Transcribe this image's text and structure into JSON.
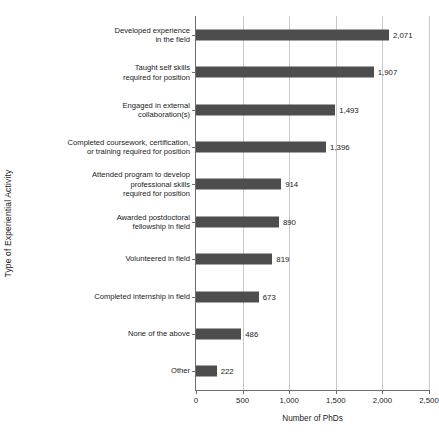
{
  "chart_data": {
    "type": "bar",
    "orientation": "horizontal",
    "title": "",
    "xlabel": "Number of PhDs",
    "ylabel": "Type of Experiential Activity",
    "xlim": [
      0,
      2500
    ],
    "xticks": [
      0,
      500,
      1000,
      1500,
      2000,
      2500
    ],
    "xtick_labels": [
      "0",
      "500",
      "1,000",
      "1,500",
      "2,000",
      "2,500"
    ],
    "grid": "vertical",
    "legend": "none",
    "bar_color": "#4d4d4d",
    "gridline_color": "#c9c9c9",
    "axis_color": "#6e6e6e",
    "categories": [
      "Developed experience\nin the field",
      "Taught self skills\nrequired for position",
      "Engaged in external\ncollaboration(s)",
      "Completed coursework, certification,\nor training required for position",
      "Attended program to develop\nprofessional skills\nrequired for position",
      "Awarded postdoctoral\nfellowship in field",
      "Volunteered in field",
      "Completed internship in field",
      "None of the above",
      "Other"
    ],
    "values": [
      2071,
      1907,
      1493,
      1396,
      914,
      890,
      819,
      673,
      486,
      222
    ],
    "value_labels": [
      "2,071",
      "1,907",
      "1,493",
      "1,396",
      "914",
      "890",
      "819",
      "673",
      "486",
      "222"
    ]
  }
}
